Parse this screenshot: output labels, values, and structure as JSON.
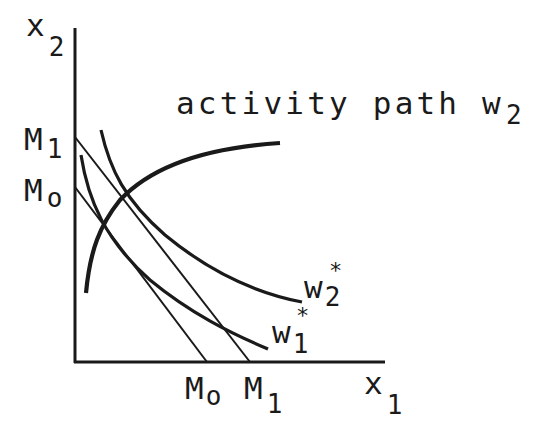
{
  "diagram": {
    "axes": {
      "y_label": {
        "base": "x",
        "sub": "2"
      },
      "x_label": {
        "base": "x",
        "sub": "1"
      }
    },
    "y_ticks": [
      {
        "base": "M",
        "sub": "1"
      },
      {
        "base": "M",
        "sub": "o"
      }
    ],
    "x_ticks": [
      {
        "base": "M",
        "sub": "o"
      },
      {
        "base": "M",
        "sub": "1"
      }
    ],
    "curves": {
      "activity_path": {
        "label": "activity path w",
        "sub": "2"
      },
      "w2_star": {
        "base": "w",
        "sup": "*",
        "sub": "2"
      },
      "w1_star": {
        "base": "w",
        "sup": "*",
        "sub": "1"
      }
    },
    "colors": {
      "ink": "#1a1a1a",
      "background": "#ffffff"
    }
  }
}
